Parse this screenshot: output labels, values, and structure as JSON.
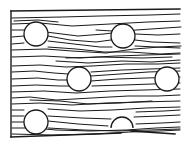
{
  "figure": {
    "title": "Fiber flow lines deflected around circular inclusions",
    "width": 187,
    "height": 147,
    "background_color": "#ffffff",
    "line_color": "#1a1a1a",
    "frame_color": "#1a1a1a"
  },
  "frame": {
    "top": {
      "x1": 11,
      "y1": 11,
      "x2": 180,
      "y2": 9
    },
    "left": {
      "x1": 11,
      "y1": 11,
      "x2": 11,
      "y2": 137
    },
    "bottom": {
      "x1": 11,
      "y1": 137,
      "x2": 121,
      "y2": 133
    },
    "bottom_tail": {
      "x1": 131,
      "y1": 131,
      "x2": 175,
      "y2": 134
    }
  },
  "inclusions": [
    {
      "id": "inclusion-top-left",
      "cx": 36,
      "cy": 34,
      "r": 12,
      "shape": "circle"
    },
    {
      "id": "inclusion-top-right",
      "cx": 123,
      "cy": 36,
      "r": 12,
      "shape": "circle"
    },
    {
      "id": "inclusion-middle-left",
      "cx": 79,
      "cy": 79,
      "r": 12,
      "shape": "circle"
    },
    {
      "id": "inclusion-middle-right-clipped",
      "cx": 167,
      "cy": 79,
      "r": 12,
      "shape": "circle-clipped-right"
    },
    {
      "id": "inclusion-bottom-left",
      "cx": 36,
      "cy": 122,
      "r": 12,
      "shape": "circle"
    },
    {
      "id": "inclusion-bottom-right",
      "cx": 122,
      "cy": 124,
      "r": 11,
      "shape": "semicircle-open-bottom"
    }
  ],
  "flow_lines": [
    {
      "id": "line-01",
      "d": "M12,18 L62,17 L100,16 L150,15 L180,14"
    },
    {
      "id": "line-02",
      "d": "M12,24 L40,23 L72,26 L110,24 L148,22 L180,21"
    },
    {
      "id": "line-03",
      "d": "M12,30 L24,30 Q32,29 46,32 L78,36 L104,34 L136,30 L166,28 L181,27"
    },
    {
      "id": "line-04",
      "d": "M12,37 L24,36 M48,36 L70,40 L96,42 L111,40"
    },
    {
      "id": "line-05",
      "d": "M12,44 L24,43 M48,41 L74,44 L100,47 L112,47 M135,40 L152,42 L180,43"
    },
    {
      "id": "line-06",
      "d": "M12,50 L46,49 L72,51 L106,53 L134,49 L160,47 L181,46"
    },
    {
      "id": "line-07",
      "d": "M48,47 L76,49 L104,52 L130,52 L160,54 L180,53"
    },
    {
      "id": "line-08",
      "d": "M12,57 L44,56 L80,58 L116,56 L146,55 L180,54"
    },
    {
      "id": "line-09",
      "d": "M56,61 L88,63 L122,61 L152,62 L180,60"
    },
    {
      "id": "line-10",
      "d": "M12,66 L40,65 L66,67 L92,66 L126,64 L158,64 L180,63"
    },
    {
      "id": "line-11",
      "d": "M12,72 L34,71 L54,73 L68,74 M91,76 L120,74 L148,72 L180,71"
    },
    {
      "id": "line-12",
      "d": "M12,79 L38,78 L58,80 L68,80 M91,81 L118,79 L146,78 L180,77"
    },
    {
      "id": "line-13",
      "d": "M12,86 L36,85 L60,86 L70,86 M92,86 L124,85 L152,84 L180,83"
    },
    {
      "id": "line-14",
      "d": "M12,92 L44,91 L76,93 L110,91 L144,90 L180,89"
    },
    {
      "id": "line-15",
      "d": "M12,98 L30,97 L56,100 L92,98 L128,96 L158,96 L180,95"
    },
    {
      "id": "line-16",
      "d": "M12,104 L40,103 L72,105 L106,103 L140,102 L180,101"
    },
    {
      "id": "line-17",
      "d": "M30,100 L60,101 L88,104 L120,103 L152,101"
    },
    {
      "id": "line-18",
      "d": "M12,110 L24,110 M48,109 L80,111 L112,110 L146,108 L180,107"
    },
    {
      "id": "line-19",
      "d": "M12,116 L24,116 M48,116 L82,118 L111,119 M134,117 L160,116 L180,115"
    },
    {
      "id": "line-20",
      "d": "M12,122 L24,122 M48,121 L78,124 L108,126 M136,124 L162,123 L180,122"
    },
    {
      "id": "line-21",
      "d": "M12,128 L34,128 L56,130 L90,131 L126,130 L156,128 L180,127"
    },
    {
      "id": "line-22",
      "d": "M48,128 L84,130 L118,131 L150,130 L180,129"
    },
    {
      "id": "line-23",
      "d": "M12,134 L52,135 L96,134 L130,132 L160,131 L180,130"
    },
    {
      "id": "line-24",
      "d": "M66,58 L100,57 L142,58 L172,57"
    },
    {
      "id": "line-25",
      "d": "M14,21 L38,20 L58,22"
    },
    {
      "id": "line-26",
      "d": "M96,30 L112,31"
    },
    {
      "id": "line-27",
      "d": "M135,34 L158,35 L180,34"
    },
    {
      "id": "line-28",
      "d": "M135,46 L156,47 L180,48"
    },
    {
      "id": "line-29",
      "d": "M91,72 L122,70 L150,69 L180,68"
    },
    {
      "id": "line-30",
      "d": "M136,112 L164,111 L180,110"
    }
  ]
}
